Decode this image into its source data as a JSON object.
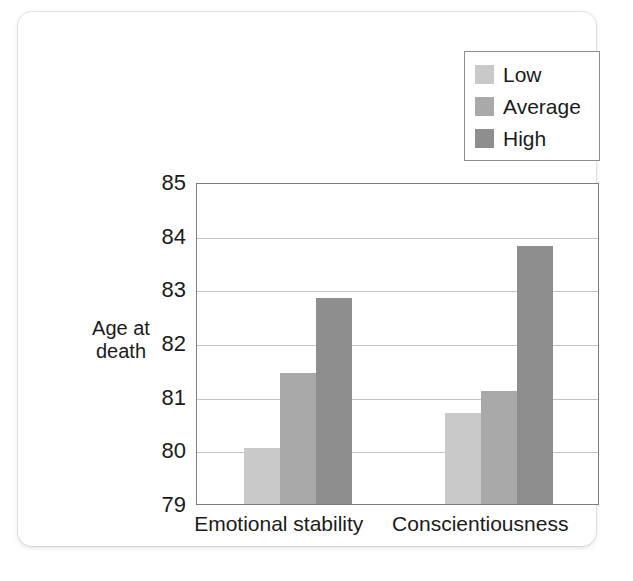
{
  "chart_data": {
    "type": "bar",
    "title": "",
    "xlabel": "",
    "ylabel": "Age at death",
    "ylabel_line1": "Age at",
    "ylabel_line2": "death",
    "categories": [
      "Emotional stability",
      "Conscientiousness"
    ],
    "series": [
      {
        "name": "Low",
        "values": [
          80.05,
          80.7
        ],
        "color": "#c9c9c9"
      },
      {
        "name": "Average",
        "values": [
          81.45,
          81.1
        ],
        "color": "#a9a9a9"
      },
      {
        "name": "High",
        "values": [
          82.83,
          83.8
        ],
        "color": "#8e8e8e"
      }
    ],
    "ylim": [
      79,
      85
    ],
    "yticks": [
      85,
      84,
      83,
      82,
      81,
      80,
      79
    ],
    "ytick_labels": [
      "85",
      "84",
      "83",
      "82",
      "81",
      "80",
      "79"
    ],
    "grid": true,
    "legend_position": "top-right",
    "legend_entries": [
      "Low",
      "Average",
      "High"
    ]
  },
  "legend": {
    "items": [
      {
        "label": "Low"
      },
      {
        "label": "Average"
      },
      {
        "label": "High"
      }
    ]
  },
  "axes": {
    "y_title_line1": "Age at",
    "y_title_line2": "death",
    "y_ticks": [
      "85",
      "84",
      "83",
      "82",
      "81",
      "80",
      "79"
    ],
    "x_categories": [
      "Emotional stability",
      "Conscientiousness"
    ]
  }
}
